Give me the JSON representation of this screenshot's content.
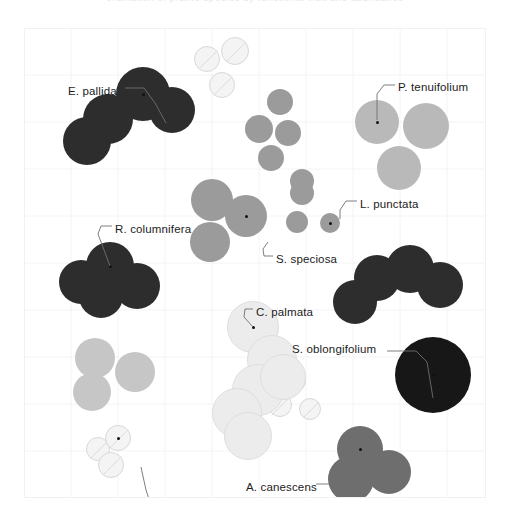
{
  "figure": {
    "title_remnant": "ordination of prairie species by functional trait and abundance",
    "background": "#ffffff",
    "plot_border_color": "#f1f1f1",
    "grid_color": "#f4f4f4",
    "grid_spacing_px": 47
  },
  "labels": [
    {
      "id": "e-pallida",
      "text": "E. pallida",
      "x": 44,
      "y": 64,
      "anchor": "start"
    },
    {
      "id": "p-tenuifolium",
      "text": "P. tenuifolium",
      "x": 374,
      "y": 60,
      "anchor": "start"
    },
    {
      "id": "l-punctata",
      "text": "L. punctata",
      "x": 336,
      "y": 177,
      "anchor": "start"
    },
    {
      "id": "r-columnifera",
      "text": "R. columnifera",
      "x": 91,
      "y": 202,
      "anchor": "start"
    },
    {
      "id": "s-speciosa",
      "text": "S. speciosa",
      "x": 252,
      "y": 232,
      "anchor": "start"
    },
    {
      "id": "c-palmata",
      "text": "C. palmata",
      "x": 232,
      "y": 285,
      "anchor": "start"
    },
    {
      "id": "s-oblongifolium",
      "text": "S. oblongifolium",
      "x": 268,
      "y": 322,
      "anchor": "start"
    },
    {
      "id": "a-canescens",
      "text": "A. canescens",
      "x": 222,
      "y": 460,
      "anchor": "start"
    },
    {
      "id": "r-hirta",
      "text": "R. hirta",
      "x": 142,
      "y": 484,
      "anchor": "start"
    }
  ],
  "leader_lines": [
    {
      "id": "leader-e-pallida",
      "points": "101,60 120,60 131,75 142,95"
    },
    {
      "id": "leader-p-tenuifolium",
      "points": "371,57 360,57 353,66 353,92"
    },
    {
      "id": "leader-l-punctata",
      "points": "333,173 322,173 316,182 316,191"
    },
    {
      "id": "leader-r-columnifera",
      "points": "88,198 77,198 74,206 86,238"
    },
    {
      "id": "leader-s-speciosa",
      "points": "249,228 240,228 239,221 244,214"
    },
    {
      "id": "leader-c-palmata",
      "points": "229,281 221,281 220,289 229,299"
    },
    {
      "id": "leader-s-oblongifolium",
      "points": "363,323 392,323 403,334 409,370"
    },
    {
      "id": "leader-a-canescens",
      "points": "292,456 305,456 322,452 336,446"
    },
    {
      "id": "leader-r-hirta",
      "points": "139,480 128,480 122,462 117,439"
    }
  ],
  "chart_data": {
    "type": "scatter",
    "title": "",
    "xlabel": "",
    "ylabel": "",
    "xlim": [
      0,
      462
    ],
    "ylim": [
      0,
      470
    ],
    "grid": true,
    "legend": "none",
    "note": "Bubble / circle-packing ordination. Each species is a cluster of overlapping circles; circle radius encodes abundance, gray level encodes species group. Coordinates are in plot-area pixels (origin = top-left of plot area at page 24,28).",
    "series": [
      {
        "name": "E. pallida",
        "fill": "#2d2d2d",
        "stroke": "none",
        "labeled_point": {
          "x": 119,
          "y": 66
        },
        "circles": [
          {
            "x": 63,
            "y": 113,
            "r": 24
          },
          {
            "x": 84,
            "y": 91,
            "r": 25
          },
          {
            "x": 119,
            "y": 66,
            "r": 27
          },
          {
            "x": 148,
            "y": 82,
            "r": 23
          }
        ]
      },
      {
        "name": "R. hirta",
        "fill": "#f4f4f4",
        "stroke": "#d8d8d8",
        "split": true,
        "labeled_point": {
          "x": 94,
          "y": 410
        },
        "circles": [
          {
            "x": 183,
            "y": 31,
            "r": 13
          },
          {
            "x": 211,
            "y": 23,
            "r": 14
          },
          {
            "x": 198,
            "y": 57,
            "r": 13
          },
          {
            "x": 74,
            "y": 421,
            "r": 12
          },
          {
            "x": 94,
            "y": 410,
            "r": 13
          },
          {
            "x": 87,
            "y": 437,
            "r": 13
          },
          {
            "x": 271,
            "y": 353,
            "r": 11
          },
          {
            "x": 256,
            "y": 377,
            "r": 12
          },
          {
            "x": 286,
            "y": 381,
            "r": 11
          }
        ]
      },
      {
        "name": "L. punctata",
        "fill": "#9b9b9b",
        "stroke": "none",
        "labeled_point": {
          "x": 306,
          "y": 195
        },
        "circles": [
          {
            "x": 256,
            "y": 74,
            "r": 13
          },
          {
            "x": 235,
            "y": 101,
            "r": 14
          },
          {
            "x": 264,
            "y": 105,
            "r": 13
          },
          {
            "x": 247,
            "y": 130,
            "r": 13
          },
          {
            "x": 278,
            "y": 153,
            "r": 12
          },
          {
            "x": 278,
            "y": 165,
            "r": 12
          },
          {
            "x": 306,
            "y": 195,
            "r": 10
          },
          {
            "x": 273,
            "y": 194,
            "r": 11
          }
        ]
      },
      {
        "name": "P. tenuifolium",
        "fill": "#b9b9b9",
        "stroke": "none",
        "labeled_point": {
          "x": 353,
          "y": 94
        },
        "circles": [
          {
            "x": 353,
            "y": 94,
            "r": 22
          },
          {
            "x": 402,
            "y": 98,
            "r": 23
          },
          {
            "x": 375,
            "y": 140,
            "r": 22
          }
        ]
      },
      {
        "name": "R. columnifera",
        "fill": "#2d2d2d",
        "stroke": "none",
        "labeled_point": {
          "x": 86,
          "y": 238
        },
        "circles": [
          {
            "x": 57,
            "y": 254,
            "r": 22
          },
          {
            "x": 86,
            "y": 238,
            "r": 24
          },
          {
            "x": 77,
            "y": 268,
            "r": 22
          },
          {
            "x": 113,
            "y": 258,
            "r": 23
          }
        ]
      },
      {
        "name": "S. speciosa",
        "fill": "#9b9b9b",
        "stroke": "none",
        "labeled_point": {
          "x": 222,
          "y": 188
        },
        "circles": [
          {
            "x": 188,
            "y": 172,
            "r": 21
          },
          {
            "x": 186,
            "y": 214,
            "r": 20
          },
          {
            "x": 222,
            "y": 188,
            "r": 21
          }
        ]
      },
      {
        "name": "L. punctata cluster (dark arc)",
        "fill": "#2d2d2d",
        "stroke": "none",
        "circles": [
          {
            "x": 331,
            "y": 274,
            "r": 22
          },
          {
            "x": 353,
            "y": 250,
            "r": 23
          },
          {
            "x": 386,
            "y": 241,
            "r": 24
          },
          {
            "x": 416,
            "y": 257,
            "r": 23
          }
        ]
      },
      {
        "name": "light gray pair",
        "fill": "#c6c6c6",
        "stroke": "none",
        "circles": [
          {
            "x": 71,
            "y": 330,
            "r": 20
          },
          {
            "x": 111,
            "y": 344,
            "r": 20
          },
          {
            "x": 68,
            "y": 364,
            "r": 19
          }
        ]
      },
      {
        "name": "C. palmata",
        "fill": "#ececec",
        "stroke": "#dedede",
        "labeled_point": {
          "x": 229,
          "y": 299
        },
        "circles": [
          {
            "x": 229,
            "y": 299,
            "r": 26
          },
          {
            "x": 248,
            "y": 332,
            "r": 25
          },
          {
            "x": 234,
            "y": 362,
            "r": 26
          },
          {
            "x": 213,
            "y": 385,
            "r": 25
          },
          {
            "x": 224,
            "y": 408,
            "r": 24
          },
          {
            "x": 259,
            "y": 349,
            "r": 23
          }
        ]
      },
      {
        "name": "S. oblongifolium",
        "fill": "#171717",
        "stroke": "none",
        "labeled_point": {
          "x": 409,
          "y": 347
        },
        "circles": [
          {
            "x": 409,
            "y": 347,
            "r": 38
          }
        ]
      },
      {
        "name": "A. canescens",
        "fill": "#6e6e6e",
        "stroke": "none",
        "labeled_point": {
          "x": 336,
          "y": 421
        },
        "circles": [
          {
            "x": 336,
            "y": 421,
            "r": 23
          },
          {
            "x": 327,
            "y": 451,
            "r": 23
          },
          {
            "x": 365,
            "y": 444,
            "r": 22
          }
        ]
      }
    ]
  }
}
